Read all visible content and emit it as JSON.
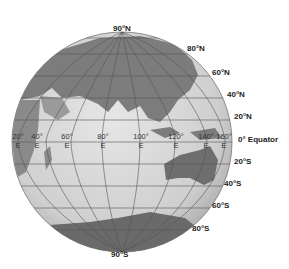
{
  "map": {
    "type": "orthographic-globe",
    "colors": {
      "ocean": "#d4d4d4",
      "land": "#7a7a7a",
      "land_light": "#a9a9a9",
      "grid": "#5a5a5a",
      "text": "#222222"
    },
    "latitude_labels": [
      {
        "label": "90°N",
        "x": 113,
        "y": 24
      },
      {
        "label": "80°N",
        "x": 187,
        "y": 44
      },
      {
        "label": "60°N",
        "x": 212,
        "y": 68
      },
      {
        "label": "40°N",
        "x": 227,
        "y": 90
      },
      {
        "label": "20°N",
        "x": 234,
        "y": 112
      },
      {
        "label": "0° Equator",
        "x": 238,
        "y": 135
      },
      {
        "label": "20°S",
        "x": 234,
        "y": 157
      },
      {
        "label": "40°S",
        "x": 224,
        "y": 179
      },
      {
        "label": "60°S",
        "x": 212,
        "y": 201
      },
      {
        "label": "80°S",
        "x": 192,
        "y": 224
      },
      {
        "label": "90°S",
        "x": 111,
        "y": 250
      }
    ],
    "longitude_labels": [
      {
        "deg": "20°",
        "hem": "E",
        "x": 9
      },
      {
        "deg": "40°",
        "hem": "E",
        "x": 28
      },
      {
        "deg": "60°",
        "hem": "E",
        "x": 58
      },
      {
        "deg": "80°",
        "hem": "E",
        "x": 94
      },
      {
        "deg": "100°",
        "hem": "E",
        "x": 132
      },
      {
        "deg": "120°",
        "hem": "E",
        "x": 167
      },
      {
        "deg": "140°",
        "hem": "E",
        "x": 197
      },
      {
        "deg": "160°",
        "hem": "E",
        "x": 215
      }
    ]
  }
}
